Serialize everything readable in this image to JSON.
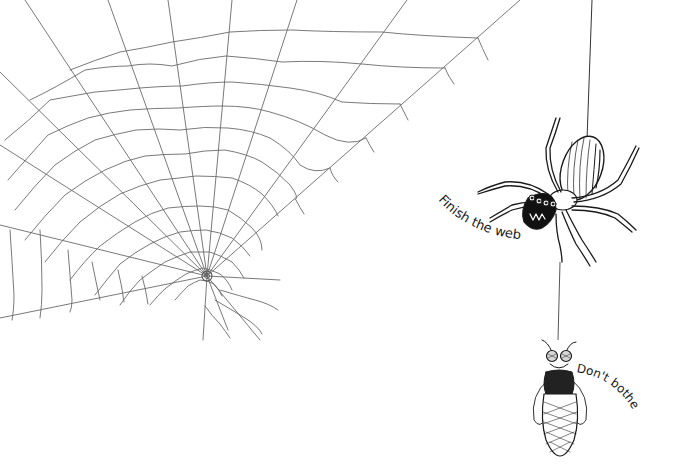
{
  "illustration": {
    "style": "hand-drawn pen sketch",
    "background_color": "#ffffff",
    "ink_color": "#1a1a1a",
    "web_line_color": "#6a6a6a",
    "web": {
      "label": "unfinished spider web",
      "center": [
        207,
        276
      ]
    },
    "spider": {
      "label": "spider hanging on thread",
      "speech": "Finish the web"
    },
    "fly": {
      "label": "fly wrapped in silk hanging below spider",
      "speech": "Don't bother"
    }
  }
}
